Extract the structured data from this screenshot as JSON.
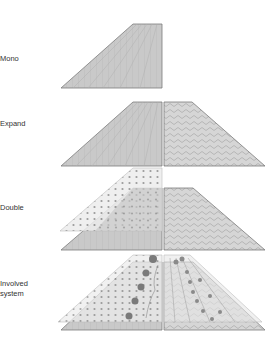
{
  "labels": {
    "mono": "Mono",
    "expand": "Expand",
    "double": "Double",
    "involved": "Involved\nsystem"
  },
  "colors": {
    "grey_fill": "#c9c9c9",
    "light_fill": "#ececec",
    "edge": "#7c7c7c",
    "line": "#b0b0b0",
    "dot": "#8a8a8a"
  }
}
